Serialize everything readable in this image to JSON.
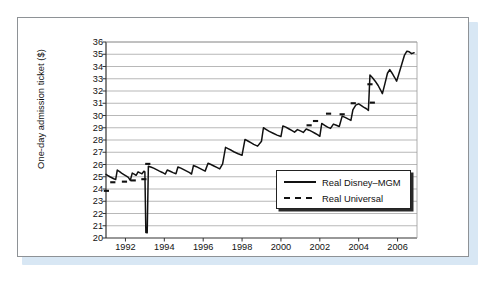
{
  "figure": {
    "caption_visible": false,
    "background_color": "#ffffff",
    "card_border_color": "#8e9296",
    "shadow_color": "#d8e7f4"
  },
  "chart_data": {
    "type": "line",
    "title": "",
    "xlabel": "",
    "ylabel": "One-day admission ticket ($)",
    "xlim": [
      1991.0,
      2007.0
    ],
    "ylim": [
      20,
      36
    ],
    "yticks": [
      20,
      21,
      22,
      23,
      24,
      25,
      26,
      27,
      28,
      29,
      30,
      31,
      32,
      33,
      34,
      35,
      36
    ],
    "xticks": [
      1992,
      1994,
      1996,
      1998,
      2000,
      2002,
      2004,
      2006
    ],
    "grid": "horizontal",
    "grid_color": "#9a9a9a",
    "legend_position": "lower-right-inside",
    "series": [
      {
        "name": "Real Disney-MGM",
        "style": "solid",
        "color": "#111111",
        "points": [
          [
            1991.0,
            25.2
          ],
          [
            1991.1,
            25.1
          ],
          [
            1991.2,
            25.0
          ],
          [
            1991.3,
            24.92
          ],
          [
            1991.4,
            24.84
          ],
          [
            1991.5,
            24.78
          ],
          [
            1991.58,
            25.55
          ],
          [
            1991.7,
            25.42
          ],
          [
            1991.8,
            25.3
          ],
          [
            1991.92,
            25.18
          ],
          [
            1992.05,
            25.05
          ],
          [
            1992.15,
            24.95
          ],
          [
            1992.25,
            24.7
          ],
          [
            1992.35,
            25.3
          ],
          [
            1992.45,
            25.22
          ],
          [
            1992.55,
            25.12
          ],
          [
            1992.65,
            25.4
          ],
          [
            1992.75,
            25.32
          ],
          [
            1992.85,
            25.24
          ],
          [
            1992.95,
            25.45
          ],
          [
            1993.0,
            25.4
          ],
          [
            1993.05,
            20.45
          ],
          [
            1993.12,
            20.42
          ],
          [
            1993.18,
            25.85
          ],
          [
            1993.3,
            25.8
          ],
          [
            1993.45,
            25.7
          ],
          [
            1993.6,
            25.58
          ],
          [
            1993.75,
            25.46
          ],
          [
            1993.9,
            25.35
          ],
          [
            1994.05,
            25.22
          ],
          [
            1994.15,
            25.55
          ],
          [
            1994.3,
            25.45
          ],
          [
            1994.45,
            25.34
          ],
          [
            1994.6,
            25.24
          ],
          [
            1994.7,
            25.8
          ],
          [
            1994.85,
            25.7
          ],
          [
            1995.0,
            25.58
          ],
          [
            1995.15,
            25.46
          ],
          [
            1995.3,
            25.34
          ],
          [
            1995.4,
            25.22
          ],
          [
            1995.5,
            25.92
          ],
          [
            1995.65,
            25.82
          ],
          [
            1995.8,
            25.7
          ],
          [
            1995.95,
            25.58
          ],
          [
            1996.1,
            25.46
          ],
          [
            1996.25,
            26.1
          ],
          [
            1996.4,
            26.0
          ],
          [
            1996.55,
            25.88
          ],
          [
            1996.7,
            25.76
          ],
          [
            1996.85,
            25.64
          ],
          [
            1997.0,
            26.05
          ],
          [
            1997.15,
            27.4
          ],
          [
            1997.3,
            27.28
          ],
          [
            1997.45,
            27.16
          ],
          [
            1997.6,
            27.02
          ],
          [
            1997.8,
            26.88
          ],
          [
            1998.0,
            26.76
          ],
          [
            1998.15,
            28.05
          ],
          [
            1998.3,
            27.92
          ],
          [
            1998.45,
            27.78
          ],
          [
            1998.6,
            27.64
          ],
          [
            1998.8,
            27.5
          ],
          [
            1999.0,
            27.9
          ],
          [
            1999.1,
            29.0
          ],
          [
            1999.25,
            28.85
          ],
          [
            1999.4,
            28.7
          ],
          [
            1999.6,
            28.55
          ],
          [
            1999.8,
            28.4
          ],
          [
            2000.0,
            28.28
          ],
          [
            2000.1,
            29.15
          ],
          [
            2000.25,
            29.05
          ],
          [
            2000.4,
            28.92
          ],
          [
            2000.55,
            28.78
          ],
          [
            2000.7,
            28.64
          ],
          [
            2000.85,
            28.85
          ],
          [
            2001.0,
            28.74
          ],
          [
            2001.15,
            28.62
          ],
          [
            2001.3,
            28.9
          ],
          [
            2001.45,
            28.8
          ],
          [
            2001.6,
            28.68
          ],
          [
            2001.75,
            28.55
          ],
          [
            2001.9,
            28.42
          ],
          [
            2002.0,
            28.3
          ],
          [
            2002.1,
            29.35
          ],
          [
            2002.25,
            29.2
          ],
          [
            2002.4,
            29.05
          ],
          [
            2002.55,
            28.95
          ],
          [
            2002.7,
            29.3
          ],
          [
            2002.85,
            29.2
          ],
          [
            2003.0,
            29.1
          ],
          [
            2003.15,
            29.95
          ],
          [
            2003.3,
            29.85
          ],
          [
            2003.45,
            29.72
          ],
          [
            2003.6,
            29.6
          ],
          [
            2003.7,
            30.45
          ],
          [
            2003.85,
            30.85
          ],
          [
            2004.0,
            30.95
          ],
          [
            2004.12,
            30.82
          ],
          [
            2004.25,
            30.68
          ],
          [
            2004.4,
            30.55
          ],
          [
            2004.5,
            30.42
          ],
          [
            2004.58,
            33.3
          ],
          [
            2004.7,
            33.1
          ],
          [
            2004.85,
            32.8
          ],
          [
            2005.0,
            32.45
          ],
          [
            2005.12,
            32.1
          ],
          [
            2005.22,
            31.78
          ],
          [
            2005.35,
            32.6
          ],
          [
            2005.48,
            33.45
          ],
          [
            2005.6,
            33.75
          ],
          [
            2005.72,
            33.45
          ],
          [
            2005.85,
            33.1
          ],
          [
            2005.95,
            32.8
          ],
          [
            2006.05,
            33.3
          ],
          [
            2006.2,
            34.1
          ],
          [
            2006.35,
            34.9
          ],
          [
            2006.48,
            35.25
          ],
          [
            2006.6,
            35.2
          ],
          [
            2006.72,
            35.05
          ],
          [
            2006.85,
            35.12
          ]
        ]
      },
      {
        "name": "Real Universal",
        "style": "dashed",
        "color": "#111111",
        "points": [
          [
            1991.02,
            23.85
          ],
          [
            1991.35,
            24.55
          ],
          [
            1991.95,
            24.6
          ],
          [
            1992.4,
            24.7
          ],
          [
            1992.95,
            24.8
          ],
          [
            1993.15,
            26.05
          ],
          [
            2001.45,
            29.2
          ],
          [
            2001.78,
            29.55
          ],
          [
            2002.45,
            30.15
          ],
          [
            2003.15,
            30.1
          ],
          [
            2003.72,
            31.0
          ],
          [
            2004.58,
            32.55
          ],
          [
            2004.7,
            31.05
          ]
        ]
      }
    ],
    "annotations": [
      {
        "label": "anomalous-dip",
        "x": 1993.08,
        "y": 20.43
      }
    ]
  },
  "axis": {
    "y_label": "One-day admission ticket ($)",
    "y_ticks": [
      "36",
      "35",
      "34",
      "33",
      "32",
      "31",
      "30",
      "29",
      "28",
      "27",
      "26",
      "25",
      "24",
      "23",
      "22",
      "21",
      "20"
    ],
    "x_ticks": [
      "1992",
      "1994",
      "1996",
      "1998",
      "2000",
      "2002",
      "2004",
      "2006"
    ]
  },
  "legend": {
    "entries": [
      {
        "label": "Real Disney–MGM",
        "style": "solid"
      },
      {
        "label": "Real Universal",
        "style": "dashed"
      }
    ]
  }
}
